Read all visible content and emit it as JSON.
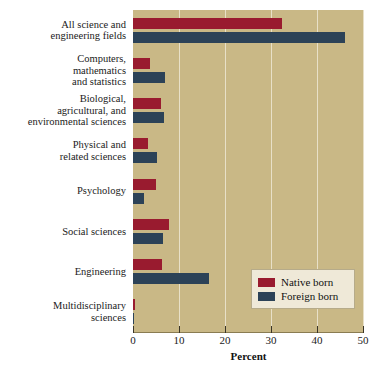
{
  "chart_data": {
    "type": "bar",
    "orientation": "horizontal",
    "title": "",
    "xlabel": "Percent",
    "ylabel": "",
    "xlim": [
      0,
      50
    ],
    "xticks": [
      0,
      10,
      20,
      30,
      40,
      50
    ],
    "xtick_labels": [
      "0",
      "10",
      "20",
      "30",
      "40",
      "50"
    ],
    "grid": true,
    "grid_axis": "x",
    "legend_position": "lower-right",
    "categories": [
      "All science and\nengineering fields",
      "Computers,\nmathematics\nand statistics",
      "Biological,\nagricultural, and\nenvironmental sciences",
      "Physical and\nrelated sciences",
      "Psychology",
      "Social sciences",
      "Engineering",
      "Multidisciplinary\nsciences"
    ],
    "series": [
      {
        "name": "Native born",
        "color": "#991b2f",
        "values": [
          32.3,
          3.6,
          6.0,
          3.3,
          4.9,
          7.8,
          6.2,
          0.4
        ]
      },
      {
        "name": "Foreign born",
        "color": "#2c4257",
        "values": [
          46.0,
          7.0,
          6.7,
          5.3,
          2.4,
          6.5,
          16.5,
          0.3
        ]
      }
    ]
  },
  "legend": {
    "entries": [
      {
        "label": "Native born",
        "color": "#991b2f"
      },
      {
        "label": "Foreign born",
        "color": "#2c4257"
      }
    ]
  },
  "colors": {
    "plot_background": "#c9b886",
    "page_background": "#ffffff",
    "gridline": "#e8e0c8",
    "axis": "#8a7c52",
    "native_born": "#991b2f",
    "foreign_born": "#2c4257",
    "legend_background": "#efe9d8"
  }
}
